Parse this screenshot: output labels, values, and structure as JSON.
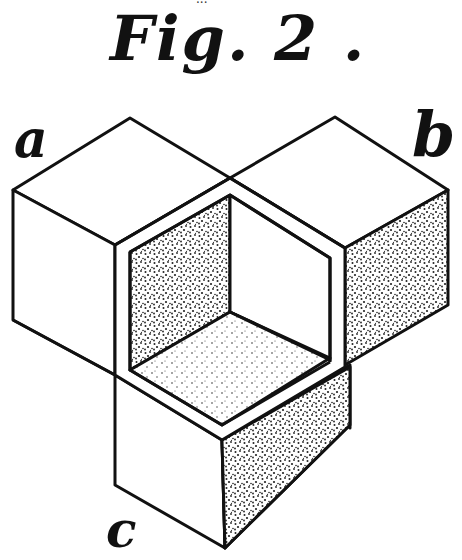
{
  "figure": {
    "top_fragment": "...",
    "title": "Fig. 2 .",
    "labels": {
      "a": "a",
      "b": "b",
      "c": "c"
    },
    "colors": {
      "ink": "#111111",
      "paper": "#ffffff",
      "stipple": "#222222"
    }
  }
}
